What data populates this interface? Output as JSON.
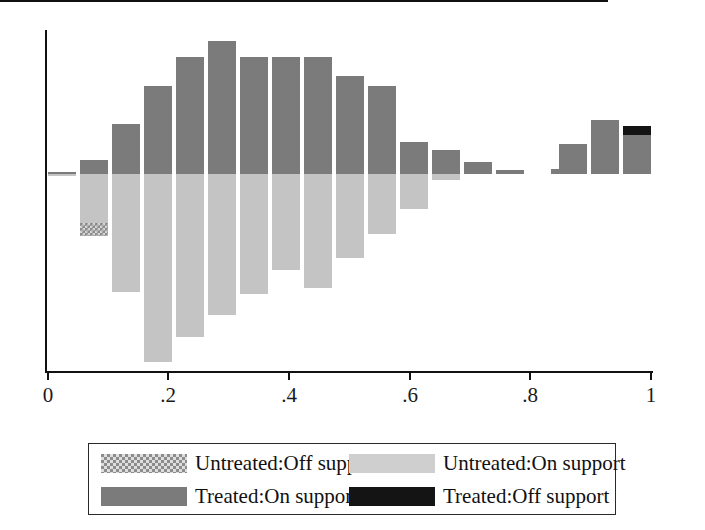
{
  "chart_data": {
    "type": "bar",
    "title": "",
    "subtitle": "",
    "xlabel": "",
    "ylabel": "",
    "xlim": [
      0,
      1
    ],
    "xticks": [
      0,
      0.2,
      0.4,
      0.6,
      0.8,
      1
    ],
    "xtick_labels": [
      "0",
      ".2",
      ".4",
      ".6",
      ".8",
      "1"
    ],
    "grid": false,
    "zero_line": true,
    "orientation": "back-to-back",
    "bin_width": 0.0333,
    "legend_position": "bottom",
    "series": [
      {
        "name": "Treated:On support",
        "color": "#7b7b7b",
        "direction": "up",
        "values": [
          0.0,
          0.02,
          0.09,
          0.26,
          0.39,
          0.46,
          0.52,
          0.44,
          0.44,
          0.44,
          0.33,
          0.31,
          0.0,
          0.11,
          0.09,
          0.05,
          0.02,
          0.0,
          0.02,
          0.11,
          0.2,
          0.17
        ]
      },
      {
        "name": "Untreated:On support",
        "color": "#c4c4c4",
        "direction": "down",
        "values": [
          0.0,
          0.17,
          0.33,
          0.61,
          0.53,
          0.46,
          0.38,
          0.33,
          0.26,
          0.21,
          0.16,
          0.11,
          0.0,
          0.0,
          0.0,
          0.0,
          0.0,
          0.0,
          0.0,
          0.0,
          0.0,
          0.0
        ]
      },
      {
        "name": "Untreated:Off support",
        "color": "#8c8c8c",
        "pattern": "checkered",
        "direction": "down",
        "values": [
          0.0,
          0.04,
          0.0,
          0.0,
          0.0,
          0.0,
          0.0,
          0.0,
          0.0,
          0.0,
          0.0,
          0.0,
          0.0,
          0.0,
          0.0,
          0.0,
          0.0,
          0.0,
          0.0,
          0.0,
          0.0,
          0.0
        ]
      },
      {
        "name": "Treated:Off support",
        "color": "#141414",
        "direction": "up",
        "values": [
          0.0,
          0.0,
          0.0,
          0.0,
          0.0,
          0.0,
          0.0,
          0.0,
          0.0,
          0.0,
          0.0,
          0.0,
          0.0,
          0.0,
          0.0,
          0.0,
          0.0,
          0.0,
          0.0,
          0.0,
          0.0,
          0.04
        ]
      }
    ]
  },
  "axis": {
    "ticks": [
      {
        "label": "0",
        "x": 48
      },
      {
        "label": ".2",
        "x": 168
      },
      {
        "label": ".4",
        "x": 289
      },
      {
        "label": ".6",
        "x": 410
      },
      {
        "label": ".8",
        "x": 530
      },
      {
        "label": "1",
        "x": 651
      }
    ]
  },
  "bars": [
    {
      "name": "bin-1",
      "left": 48,
      "width": 28,
      "up_height": 2,
      "up_black": 0,
      "down_height": 2,
      "down_checker": 0
    },
    {
      "name": "bin-2",
      "left": 80,
      "width": 28,
      "up_height": 14,
      "up_black": 0,
      "down_height": 62,
      "down_checker": 13
    },
    {
      "name": "bin-3",
      "left": 112,
      "width": 28,
      "up_height": 50,
      "up_black": 0,
      "down_height": 118,
      "down_checker": 0
    },
    {
      "name": "bin-4",
      "left": 144,
      "width": 28,
      "up_height": 88,
      "up_black": 0,
      "down_height": 188,
      "down_checker": 0
    },
    {
      "name": "bin-5",
      "left": 176,
      "width": 28,
      "up_height": 117,
      "up_black": 0,
      "down_height": 163,
      "down_checker": 0
    },
    {
      "name": "bin-6",
      "left": 208,
      "width": 28,
      "up_height": 133,
      "up_black": 0,
      "down_height": 141,
      "down_checker": 0
    },
    {
      "name": "bin-7",
      "left": 240,
      "width": 28,
      "up_height": 117,
      "up_black": 0,
      "down_height": 120,
      "down_checker": 0
    },
    {
      "name": "bin-8",
      "left": 272,
      "width": 28,
      "up_height": 117,
      "up_black": 0,
      "down_height": 96,
      "down_checker": 0
    },
    {
      "name": "bin-9",
      "left": 304,
      "width": 28,
      "up_height": 117,
      "up_black": 0,
      "down_height": 114,
      "down_checker": 0
    },
    {
      "name": "bin-10",
      "left": 336,
      "width": 28,
      "up_height": 98,
      "up_black": 0,
      "down_height": 84,
      "down_checker": 0
    },
    {
      "name": "bin-11",
      "left": 368,
      "width": 28,
      "up_height": 88,
      "up_black": 0,
      "down_height": 60,
      "down_checker": 0
    },
    {
      "name": "bin-12",
      "left": 400,
      "width": 28,
      "up_height": 32,
      "up_black": 0,
      "down_height": 35,
      "down_checker": 0
    },
    {
      "name": "bin-13",
      "left": 432,
      "width": 28,
      "up_height": 24,
      "up_black": 0,
      "down_height": 6,
      "down_checker": 0
    },
    {
      "name": "bin-14",
      "left": 464,
      "width": 28,
      "up_height": 12,
      "up_black": 0,
      "down_height": 0,
      "down_checker": 0
    },
    {
      "name": "bin-15",
      "left": 496,
      "width": 28,
      "up_height": 4,
      "up_black": 0,
      "down_height": 0,
      "down_checker": 0
    },
    {
      "name": "bin-16",
      "left": 528,
      "width": 28,
      "up_height": 0,
      "up_black": 0,
      "down_height": 0,
      "down_checker": 0
    },
    {
      "name": "bin-17",
      "left": 551,
      "width": 28,
      "up_height": 5,
      "up_black": 0,
      "down_height": 0,
      "down_checker": 0
    },
    {
      "name": "bin-18",
      "left": 559,
      "width": 28,
      "up_height": 30,
      "up_black": 0,
      "down_height": 0,
      "down_checker": 0
    },
    {
      "name": "bin-19",
      "left": 591,
      "width": 28,
      "up_height": 54,
      "up_black": 0,
      "down_height": 0,
      "down_checker": 0
    },
    {
      "name": "bin-20",
      "left": 623,
      "width": 28,
      "up_height": 48,
      "up_black": 9,
      "down_height": 0,
      "down_checker": 0
    }
  ],
  "legend": {
    "entries": [
      {
        "swatch": "untreated-off",
        "label": "Untreated:Off support"
      },
      {
        "swatch": "untreated-on",
        "label": "Untreated:On support"
      },
      {
        "swatch": "treated-on",
        "label": "Treated:On support"
      },
      {
        "swatch": "treated-off",
        "label": "Treated:Off support"
      }
    ]
  },
  "colors": {
    "treated_on": "#7b7b7b",
    "untreated_on": "#c4c4c4",
    "treated_off": "#141414",
    "untreated_off": "#8c8c8c",
    "axis": "#111111",
    "background": "#ffffff"
  }
}
